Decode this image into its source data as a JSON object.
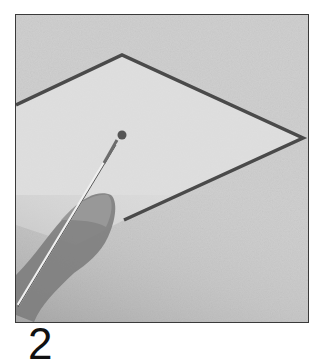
{
  "figure": {
    "step_number": "2",
    "colors": {
      "wall": "#cfcfcf",
      "highlight": "#e4e4e4",
      "outline_paint": "#4a4a4a",
      "frame_border": "#3a3a3a"
    }
  }
}
